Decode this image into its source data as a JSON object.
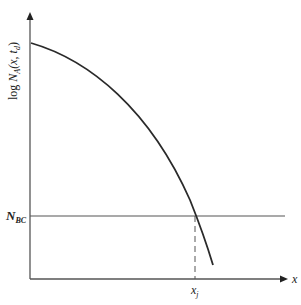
{
  "diagram": {
    "type": "junction-profile",
    "y_axis_label": {
      "prefix": "log ",
      "symbol": "N",
      "subscript": "A",
      "args": "(x, t",
      "arg_sub": "d",
      "close": ")"
    },
    "x_axis_label": "x",
    "horizontal_line_label": {
      "symbol": "N",
      "subscript": "BC"
    },
    "marker_label": {
      "symbol": "x",
      "subscript": "j"
    },
    "colors": {
      "line": "#2a2a2a",
      "axis": "#555555",
      "background": "#ffffff"
    }
  }
}
